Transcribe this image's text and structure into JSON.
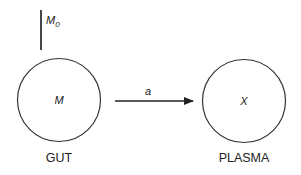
{
  "diagram": {
    "type": "compartment-model",
    "dose": {
      "symbol": "M",
      "subscript": "0"
    },
    "compartments": [
      {
        "id": "gut",
        "label": "GUT",
        "content": "M"
      },
      {
        "id": "plasma",
        "label": "PLASMA",
        "content": "X"
      }
    ],
    "transfer": {
      "from": "gut",
      "to": "plasma",
      "rate_label": "a"
    },
    "colors": {
      "stroke": "#333333",
      "text": "#222222",
      "background": "#ffffff"
    }
  }
}
